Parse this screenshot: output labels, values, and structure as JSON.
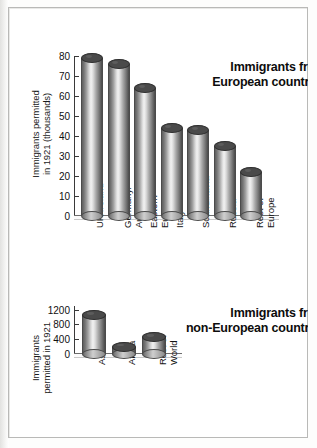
{
  "document": {
    "kind": "textbook-figure-scan",
    "charts": 2
  },
  "chart_data": [
    {
      "id": "european",
      "type": "bar",
      "title": "Immigrants from",
      "title_line2": "European countries",
      "ylabel": "Immigrants permitted",
      "ylabel_line2": "in 1921 (thousands)",
      "xlabel": "",
      "categories": [
        "UK/Ireland",
        "Germany/ Austria",
        "Eastern Europe",
        "Italy",
        "Scandinavia",
        "Russia",
        "Rest of Europe"
      ],
      "category_lines": [
        [
          "UK/Ireland"
        ],
        [
          "Germany/",
          "Austria"
        ],
        [
          "Eastern",
          "Europe"
        ],
        [
          "Italy"
        ],
        [
          "Scandinavia"
        ],
        [
          "Russia"
        ],
        [
          "Rest of",
          "Europe"
        ]
      ],
      "values": [
        79,
        76,
        64,
        44,
        43,
        35,
        22
      ],
      "ylim": [
        0,
        80
      ],
      "yticks": [
        0,
        10,
        20,
        30,
        40,
        50,
        60,
        70,
        80
      ],
      "ytick_labels": [
        "0",
        "10",
        "20",
        "30",
        "40",
        "50",
        "60",
        "70",
        "80"
      ],
      "grid": false,
      "legend": "none"
    },
    {
      "id": "non-european",
      "type": "bar",
      "title": "Immigrants from",
      "title_line2": "non-European countries",
      "ylabel": "Immigrants",
      "ylabel_line2": "permitted in 1921",
      "xlabel": "",
      "categories": [
        "Asia",
        "Africa",
        "Rest of World"
      ],
      "category_lines": [
        [
          "Asia"
        ],
        [
          "Africa"
        ],
        [
          "Rest of",
          "World"
        ]
      ],
      "values": [
        1050,
        200,
        450
      ],
      "ylim": [
        0,
        1300
      ],
      "yticks": [
        0,
        400,
        800,
        1200
      ],
      "ytick_labels": [
        "0",
        "400",
        "800",
        "1200"
      ],
      "grid": false,
      "legend": "none"
    }
  ],
  "colors": {
    "bar_dark": "#4a4a4a",
    "bar_light": "#f2f2f2",
    "axis": "#3a3a3a",
    "text": "#111111",
    "page": "#ffffff",
    "frame": "#b9b9b7"
  }
}
